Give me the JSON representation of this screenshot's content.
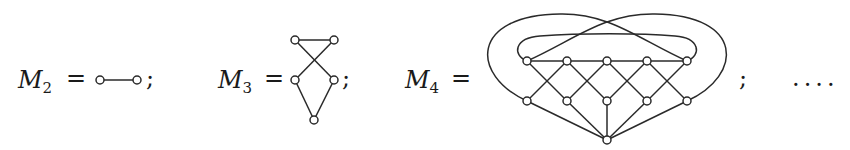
{
  "diagram": {
    "graphs": [
      {
        "name": "M",
        "subscript": "2",
        "equals": "=",
        "terminator": ";",
        "nodes": [
          [
            100,
            80
          ],
          [
            137,
            80
          ]
        ],
        "edges": [
          [
            0,
            1
          ]
        ]
      },
      {
        "name": "M",
        "subscript": "3",
        "equals": "=",
        "terminator": ";",
        "nodes": [
          [
            295,
            40
          ],
          [
            334,
            40
          ],
          [
            295,
            80
          ],
          [
            334,
            80
          ],
          [
            314,
            120
          ]
        ],
        "edges": [
          [
            0,
            1
          ],
          [
            0,
            3
          ],
          [
            1,
            2
          ],
          [
            2,
            4
          ],
          [
            3,
            4
          ]
        ]
      },
      {
        "name": "M",
        "subscript": "4",
        "equals": "=",
        "terminator": ";",
        "nodes": [
          [
            527,
            61
          ],
          [
            567,
            61
          ],
          [
            607,
            61
          ],
          [
            647,
            61
          ],
          [
            687,
            61
          ],
          [
            527,
            101
          ],
          [
            567,
            101
          ],
          [
            607,
            101
          ],
          [
            647,
            101
          ],
          [
            687,
            101
          ],
          [
            607,
            140
          ]
        ],
        "edges": [
          [
            0,
            4
          ],
          [
            0,
            6
          ],
          [
            1,
            5
          ],
          [
            1,
            7
          ],
          [
            2,
            6
          ],
          [
            2,
            8
          ],
          [
            3,
            7
          ],
          [
            3,
            9
          ],
          [
            4,
            8
          ],
          [
            5,
            10
          ],
          [
            6,
            10
          ],
          [
            7,
            10
          ],
          [
            8,
            10
          ],
          [
            9,
            10
          ]
        ],
        "curved_edges": [
          {
            "from": 5,
            "to": 4,
            "desc": "outer loop left"
          },
          {
            "from": 9,
            "to": 0,
            "desc": "outer loop right"
          },
          {
            "from": 0,
            "to": 4,
            "desc": "inner loop over top"
          }
        ]
      }
    ],
    "trailing": "...."
  }
}
